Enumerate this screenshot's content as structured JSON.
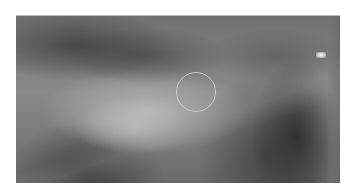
{
  "image": {
    "kind": "grayscale-photograph",
    "frame": {
      "x": 16,
      "y": 15,
      "width": 324,
      "height": 167
    },
    "annotation": {
      "shape": "circle",
      "center": [
        197,
        93
      ],
      "radius": 20,
      "color": "#c8c8c8"
    },
    "bright_spot": {
      "center": [
        320,
        54
      ],
      "color": "#f4f4f4"
    }
  }
}
